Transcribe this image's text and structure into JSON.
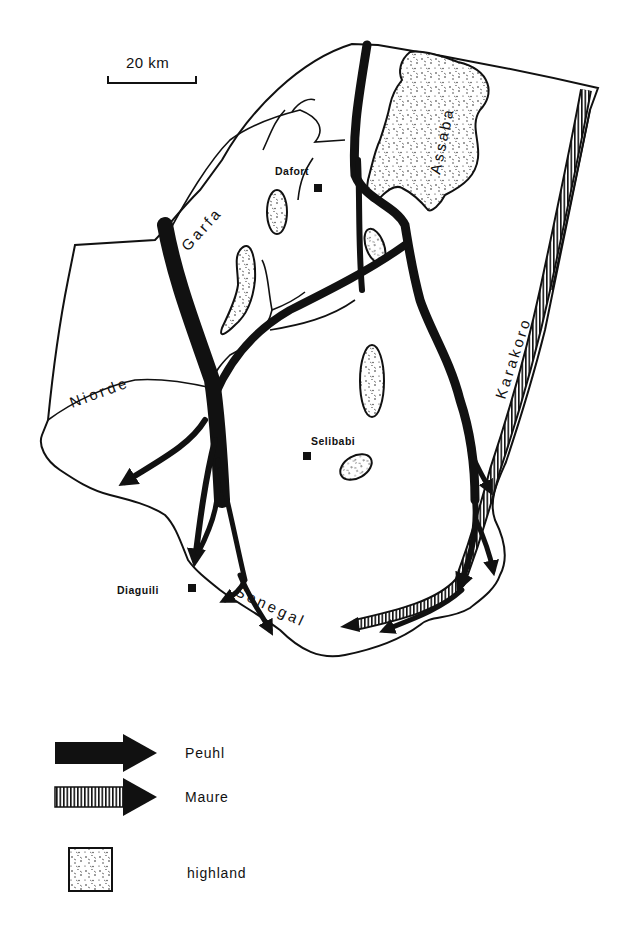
{
  "scale_bar": {
    "label": "20 km"
  },
  "regions": {
    "highland_main": "Assaba"
  },
  "rivers": {
    "garfa": "Garfa",
    "niorde": "Niorde",
    "karakoro": "Karakoro",
    "senegal": "Senegal"
  },
  "towns": {
    "dafort": "Dafort",
    "selibabi": "Selibabi",
    "diaguili": "Diaguili"
  },
  "legend": {
    "items": [
      {
        "symbol": "solid-black-arrow",
        "label": "Peuhl"
      },
      {
        "symbol": "striped-arrow",
        "label": "Maure"
      },
      {
        "symbol": "stippled-square",
        "label": "highland"
      }
    ]
  },
  "colors": {
    "ink": "#111111",
    "paper": "#ffffff"
  }
}
